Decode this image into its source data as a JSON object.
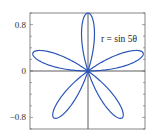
{
  "chart_data": {
    "type": "line",
    "subtype": "polar-rose",
    "title": "",
    "annotation": "r = sin 5θ",
    "equation": "r = sin(5θ)",
    "theta_range": [
      0,
      3.14159
    ],
    "petals": 5,
    "xlim": [
      -1,
      1
    ],
    "ylim": [
      -1,
      1
    ],
    "y_ticks": [
      0.8,
      0,
      -0.8
    ],
    "y_tick_labels": [
      "0.8",
      "0",
      "−0.8"
    ],
    "xlabel": "",
    "ylabel": "",
    "grid": false,
    "axes_through_origin": true,
    "series": [
      {
        "name": "r = sin 5θ",
        "color": "#2b56b8"
      }
    ]
  }
}
